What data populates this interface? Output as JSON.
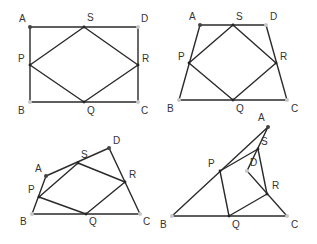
{
  "figures": [
    {
      "name": "rectangle",
      "outer": [
        "A",
        "D",
        "C",
        "B"
      ],
      "inner": [
        "P",
        "S",
        "R",
        "Q"
      ],
      "points": {
        "A": [
          30,
          27
        ],
        "D": [
          138,
          27
        ],
        "C": [
          138,
          102
        ],
        "B": [
          30,
          102
        ],
        "S": [
          84,
          27
        ],
        "R": [
          138,
          65
        ],
        "Q": [
          84,
          102
        ],
        "P": [
          30,
          65
        ]
      },
      "labels": {
        "A": {
          "text": "A",
          "pos": [
            19,
            22
          ]
        },
        "S": {
          "text": "S",
          "pos": [
            87,
            21
          ]
        },
        "D": {
          "text": "D",
          "pos": [
            141,
            22
          ]
        },
        "P": {
          "text": "P",
          "pos": [
            18,
            62
          ]
        },
        "R": {
          "text": "R",
          "pos": [
            142,
            62
          ]
        },
        "B": {
          "text": "B",
          "pos": [
            18,
            114
          ]
        },
        "Q": {
          "text": "Q",
          "pos": [
            87,
            114
          ]
        },
        "C": {
          "text": "C",
          "pos": [
            141,
            114
          ]
        }
      }
    },
    {
      "name": "trapezoid",
      "outer": [
        "A",
        "D",
        "C",
        "B"
      ],
      "inner": [
        "P",
        "S",
        "R",
        "Q"
      ],
      "points": {
        "A": [
          200,
          25
        ],
        "D": [
          266,
          25
        ],
        "C": [
          287,
          100
        ],
        "B": [
          179,
          100
        ],
        "S": [
          233,
          25
        ],
        "R": [
          276,
          63
        ],
        "Q": [
          233,
          100
        ],
        "P": [
          189,
          63
        ]
      },
      "labels": {
        "A": {
          "text": "A",
          "pos": [
            189,
            20
          ]
        },
        "S": {
          "text": "S",
          "pos": [
            236,
            20
          ]
        },
        "D": {
          "text": "D",
          "pos": [
            270,
            20
          ]
        },
        "P": {
          "text": "P",
          "pos": [
            178,
            60
          ]
        },
        "R": {
          "text": "R",
          "pos": [
            280,
            60
          ]
        },
        "B": {
          "text": "B",
          "pos": [
            167,
            112
          ]
        },
        "Q": {
          "text": "Q",
          "pos": [
            236,
            112
          ]
        },
        "C": {
          "text": "C",
          "pos": [
            291,
            112
          ]
        }
      }
    },
    {
      "name": "general-quadrilateral",
      "outer": [
        "A",
        "D",
        "C",
        "B"
      ],
      "inner": [
        "P",
        "S",
        "R",
        "Q"
      ],
      "points": {
        "A": [
          46,
          176
        ],
        "D": [
          109,
          148
        ],
        "C": [
          140,
          214
        ],
        "B": [
          32,
          214
        ],
        "S": [
          78,
          163
        ],
        "R": [
          125,
          182
        ],
        "Q": [
          86,
          214
        ],
        "P": [
          39,
          197
        ]
      },
      "labels": {
        "A": {
          "text": "A",
          "pos": [
            35,
            172
          ]
        },
        "S": {
          "text": "S",
          "pos": [
            81,
            158
          ]
        },
        "D": {
          "text": "D",
          "pos": [
            113,
            144
          ]
        },
        "P": {
          "text": "P",
          "pos": [
            28,
            193
          ]
        },
        "R": {
          "text": "R",
          "pos": [
            129,
            178
          ]
        },
        "B": {
          "text": "B",
          "pos": [
            20,
            225
          ]
        },
        "Q": {
          "text": "Q",
          "pos": [
            89,
            225
          ]
        },
        "C": {
          "text": "C",
          "pos": [
            143,
            225
          ]
        }
      }
    },
    {
      "name": "concave-quadrilateral",
      "outer": [
        "A",
        "B",
        "C",
        "D"
      ],
      "inner": [
        "P",
        "S",
        "R",
        "Q"
      ],
      "points": {
        "A": [
          268,
          127
        ],
        "B": [
          172,
          216
        ],
        "C": [
          287,
          216
        ],
        "D": [
          247,
          171
        ],
        "S": [
          258,
          149
        ],
        "R": [
          267,
          194
        ],
        "Q": [
          229,
          216
        ],
        "P": [
          220,
          171
        ]
      },
      "labels": {
        "A": {
          "text": "A",
          "pos": [
            258,
            121
          ]
        },
        "S": {
          "text": "S",
          "pos": [
            261,
            145
          ]
        },
        "D": {
          "text": "D",
          "pos": [
            250,
            166
          ]
        },
        "P": {
          "text": "P",
          "pos": [
            208,
            167
          ]
        },
        "R": {
          "text": "R",
          "pos": [
            272,
            189
          ]
        },
        "B": {
          "text": "B",
          "pos": [
            160,
            228
          ]
        },
        "Q": {
          "text": "Q",
          "pos": [
            232,
            228
          ]
        },
        "C": {
          "text": "C",
          "pos": [
            291,
            228
          ]
        }
      }
    }
  ]
}
